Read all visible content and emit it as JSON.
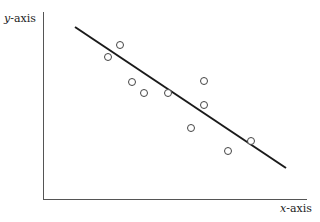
{
  "chart_data": {
    "type": "scatter",
    "title": "",
    "xlabel": "x-axis",
    "ylabel": "y-axis",
    "grid": false,
    "legend": null,
    "ticks": "none",
    "points_px": [
      {
        "x": 120,
        "y": 45
      },
      {
        "x": 108,
        "y": 57
      },
      {
        "x": 132,
        "y": 82
      },
      {
        "x": 144,
        "y": 93
      },
      {
        "x": 168,
        "y": 93
      },
      {
        "x": 204,
        "y": 81
      },
      {
        "x": 204,
        "y": 105
      },
      {
        "x": 191,
        "y": 128
      },
      {
        "x": 228,
        "y": 151
      },
      {
        "x": 251,
        "y": 141
      }
    ],
    "trend_line_px": {
      "x1": 75,
      "y1": 27,
      "x2": 286,
      "y2": 168
    },
    "trend": "negative linear correlation",
    "colors": {
      "axis": "#555555",
      "line": "#1a1a1a",
      "marker": "#444444"
    }
  },
  "labels": {
    "y_italic": "y",
    "y_rest": "-axis",
    "x_italic": "x",
    "x_rest": "-axis"
  }
}
